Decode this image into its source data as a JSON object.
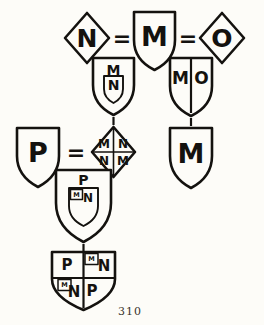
{
  "page": {
    "folio_number": "310",
    "background_color": "#fdfcf8",
    "ink_color": "#14120f",
    "width": 264,
    "height": 325
  },
  "diagram": {
    "kind": "heraldic-marshalling-descent-chart",
    "equals_signs": [
      "=",
      "=",
      "="
    ],
    "connector_label": "descent-line",
    "generation_1": {
      "label": "top-marriage-row",
      "nodes": [
        {
          "id": "n-lozenge",
          "shape": "lozenge",
          "charges": [
            "N"
          ],
          "division": "none"
        },
        {
          "id": "m-shield",
          "shape": "shield",
          "charges": [
            "M"
          ],
          "division": "none"
        },
        {
          "id": "o-lozenge",
          "shape": "lozenge",
          "charges": [
            "O"
          ],
          "division": "none"
        }
      ]
    },
    "generation_2": {
      "label": "children-row",
      "nodes": [
        {
          "id": "mn-escutcheon-shield",
          "shape": "shield",
          "charges": [
            "M"
          ],
          "division": "inescutcheon",
          "inescutcheon": {
            "shape": "shield",
            "charges": [
              "N"
            ]
          }
        },
        {
          "id": "mo-party-per-pale-shield",
          "shape": "shield",
          "division": "per-pale",
          "charges": [
            "M",
            "O"
          ]
        }
      ]
    },
    "generation_3": {
      "label": "second-marriage-row",
      "nodes": [
        {
          "id": "p-shield",
          "shape": "shield",
          "charges": [
            "P"
          ],
          "division": "none"
        },
        {
          "id": "mnnm-quartered-lozenge",
          "shape": "lozenge",
          "division": "quarterly",
          "quarters": [
            "M",
            "N",
            "N",
            "M"
          ]
        },
        {
          "id": "m-plain-shield",
          "shape": "shield",
          "charges": [
            "M"
          ],
          "division": "none"
        }
      ]
    },
    "generation_4": {
      "label": "p-escutcheon-row",
      "nodes": [
        {
          "id": "p-escutcheon-shield",
          "shape": "shield",
          "charges": [
            "P"
          ],
          "division": "inescutcheon",
          "inescutcheon": {
            "shape": "shield",
            "division": "canton",
            "canton_charge": "M",
            "charges": [
              "N"
            ]
          }
        }
      ]
    },
    "generation_5": {
      "label": "final-quartered-row",
      "nodes": [
        {
          "id": "pnnp-quartered-shield",
          "shape": "shield",
          "division": "quarterly",
          "quarters": [
            {
              "position": 1,
              "charges": [
                "P"
              ]
            },
            {
              "position": 2,
              "canton_charge": "M",
              "charges": [
                "N"
              ]
            },
            {
              "position": 3,
              "canton_charge": "M",
              "charges": [
                "N"
              ]
            },
            {
              "position": 4,
              "charges": [
                "P"
              ]
            }
          ]
        }
      ]
    }
  }
}
